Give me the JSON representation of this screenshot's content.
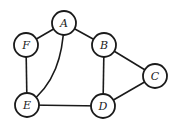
{
  "graph": {
    "nodes": [
      {
        "id": "A",
        "label": "A",
        "x": 64,
        "y": 23
      },
      {
        "id": "B",
        "label": "B",
        "x": 104,
        "y": 45
      },
      {
        "id": "C",
        "label": "C",
        "x": 155,
        "y": 76
      },
      {
        "id": "D",
        "label": "D",
        "x": 103,
        "y": 106
      },
      {
        "id": "E",
        "label": "E",
        "x": 27,
        "y": 105
      },
      {
        "id": "F",
        "label": "F",
        "x": 26,
        "y": 45
      }
    ],
    "edges": [
      {
        "from": "A",
        "to": "F"
      },
      {
        "from": "A",
        "to": "B"
      },
      {
        "from": "A",
        "to": "E",
        "curved": true
      },
      {
        "from": "F",
        "to": "E"
      },
      {
        "from": "B",
        "to": "D"
      },
      {
        "from": "B",
        "to": "C"
      },
      {
        "from": "C",
        "to": "D"
      },
      {
        "from": "E",
        "to": "D"
      }
    ],
    "node_radius": 12,
    "stroke_color": "#1a1a1a"
  }
}
